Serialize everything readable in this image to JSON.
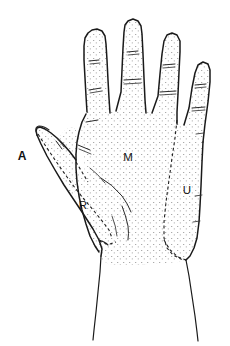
{
  "figure": {
    "background_color": "#ffffff",
    "ink_color": "#1a1a1a",
    "stipple_color": "#9a9a9a",
    "width": 230,
    "height": 346
  },
  "labels": {
    "axillary": {
      "text": "A",
      "x": 22,
      "y": 157,
      "style": "bold",
      "zone": "unshaded-outside-hand"
    },
    "radial": {
      "text": "R",
      "x": 83,
      "y": 206,
      "style": "regular",
      "zone": "thumb-palmar-unshaded"
    },
    "median": {
      "text": "M",
      "x": 128,
      "y": 158,
      "style": "regular",
      "zone": "central-dorsum-stippled"
    },
    "ulnar": {
      "text": "U",
      "x": 187,
      "y": 191,
      "style": "regular",
      "zone": "ulnar-dorsum-stippled"
    }
  },
  "zones": [
    {
      "key": "A",
      "label": "A",
      "shaded": false
    },
    {
      "key": "R",
      "label": "R",
      "shaded": false
    },
    {
      "key": "M",
      "label": "M",
      "shaded": true
    },
    {
      "key": "U",
      "label": "U",
      "shaded": true
    }
  ],
  "anatomy": {
    "digits": [
      {
        "name": "thumb",
        "crease_count": 1
      },
      {
        "name": "index-finger",
        "crease_count": 2
      },
      {
        "name": "middle-finger",
        "crease_count": 2
      },
      {
        "name": "ring-finger",
        "crease_count": 2
      },
      {
        "name": "little-finger",
        "crease_count": 2
      }
    ],
    "palm_creases": 3,
    "wrist_lines": 2
  }
}
